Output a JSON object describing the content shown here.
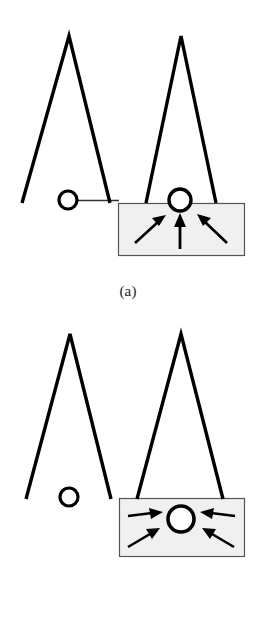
{
  "figure": {
    "title": "",
    "background_color": "#ffffff",
    "stroke_color": "#000000",
    "box_fill_color": "#f0f0f0",
    "box_stroke_color": "#555555",
    "panels": [
      {
        "id": "a",
        "caption": "(a)",
        "description": "Two inverted-V (tent) shapes; left one has a small open circle on a thin horizontal baseline, right one has an open circle at the top edge of a shaded rectangle containing three arrows pointing up and inward toward the circle.",
        "elements": {
          "left_tent": {
            "apex_x": 69,
            "apex_y": 36,
            "left_foot_x": 22,
            "right_foot_x": 110,
            "foot_y": 203
          },
          "right_tent": {
            "apex_x": 181,
            "apex_y": 36,
            "left_foot_x": 146,
            "right_foot_x": 216,
            "foot_y": 203
          },
          "baseline": {
            "x1": 68,
            "x2": 118,
            "y": 200
          },
          "left_circle": {
            "cx": 68,
            "cy": 200,
            "r": 9,
            "label": "open-circle"
          },
          "right_circle": {
            "cx": 180,
            "cy": 200,
            "r": 11,
            "label": "open-circle"
          },
          "box": {
            "x": 118,
            "y": 203,
            "width": 126,
            "height": 53
          },
          "arrows": [
            {
              "name": "arrow-up-right",
              "x1": 135,
              "y1": 243,
              "x2": 163,
              "y2": 218,
              "direction": "up-right"
            },
            {
              "name": "arrow-up",
              "x1": 180,
              "y1": 248,
              "x2": 180,
              "y2": 216,
              "direction": "up"
            },
            {
              "name": "arrow-up-left",
              "x1": 226,
              "y1": 243,
              "x2": 200,
              "y2": 217,
              "direction": "up-left"
            }
          ],
          "arrow_count": 3
        }
      },
      {
        "id": "b",
        "caption": "(b)",
        "description": "Two inverted-V (tent) shapes; left one has a small open circle below it with no baseline, right one straddles a shaded rectangle containing a larger open circle with four arrows pointing horizontally inward from left and right.",
        "elements": {
          "left_tent": {
            "apex_x": 70,
            "apex_y": 24,
            "left_foot_x": 26,
            "right_foot_x": 111,
            "foot_y": 189
          },
          "right_tent": {
            "apex_x": 181,
            "apex_y": 24,
            "left_foot_x": 137,
            "right_foot_x": 223,
            "foot_y": 188
          },
          "left_circle": {
            "cx": 69,
            "cy": 187,
            "r": 9,
            "label": "open-circle"
          },
          "center_circle": {
            "cx": 181,
            "cy": 209,
            "r": 13,
            "label": "open-circle"
          },
          "box": {
            "x": 119,
            "y": 188,
            "width": 125,
            "height": 58
          },
          "arrows": [
            {
              "name": "arrow-right-upper",
              "x1": 128,
              "y1": 206,
              "x2": 160,
              "y2": 204,
              "direction": "right"
            },
            {
              "name": "arrow-right-lower",
              "x1": 129,
              "y1": 235,
              "x2": 159,
              "y2": 218,
              "direction": "up-right"
            },
            {
              "name": "arrow-left-upper",
              "x1": 234,
              "y1": 206,
              "x2": 202,
              "y2": 204,
              "direction": "left"
            },
            {
              "name": "arrow-left-lower",
              "x1": 233,
              "y1": 235,
              "x2": 203,
              "y2": 218,
              "direction": "up-left"
            }
          ],
          "arrow_count": 4
        }
      }
    ]
  }
}
